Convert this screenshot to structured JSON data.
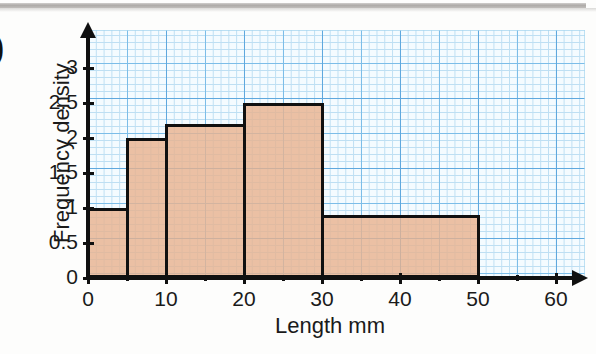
{
  "page": {
    "question_bracket": ")",
    "background_color": "#fdfdfc"
  },
  "chart_data": {
    "type": "bar",
    "title": "",
    "subtitle": "",
    "xlabel": "Length mm",
    "ylabel": "Frequency density",
    "xlim": [
      0,
      64
    ],
    "ylim": [
      0,
      3.4
    ],
    "grid": true,
    "grid_style": "graph-paper",
    "legend": null,
    "bar_fill_color": "#e9b28d",
    "bar_edge_color": "#101010",
    "grid_color": "#5fa8de",
    "axis_color": "#101010",
    "x_major_ticks": [
      0,
      10,
      20,
      30,
      40,
      50,
      60
    ],
    "x_major_tick_labels": [
      "0",
      "10",
      "20",
      "30",
      "40",
      "50",
      "60"
    ],
    "x_minor_ticks": [
      5,
      15,
      25,
      35,
      45,
      55
    ],
    "y_ticks": [
      0,
      0.5,
      1,
      1.5,
      2,
      2.5,
      3
    ],
    "y_tick_labels": [
      "0",
      "0.5",
      "1",
      "1.5",
      "2",
      "2.5",
      "3"
    ],
    "bins": [
      {
        "label": "0-5",
        "x_start": 0,
        "x_end": 5,
        "frequency_density": 1,
        "width": 5,
        "frequency": 5
      },
      {
        "label": "5-10",
        "x_start": 5,
        "x_end": 10,
        "frequency_density": 2,
        "width": 5,
        "frequency": 10
      },
      {
        "label": "10-20",
        "x_start": 10,
        "x_end": 20,
        "frequency_density": 2.2,
        "width": 10,
        "frequency": 22
      },
      {
        "label": "20-30",
        "x_start": 20,
        "x_end": 30,
        "frequency_density": 2.5,
        "width": 10,
        "frequency": 25
      },
      {
        "label": "30-50",
        "x_start": 30,
        "x_end": 50,
        "frequency_density": 0.9,
        "width": 20,
        "frequency": 18
      }
    ],
    "categories": [
      "0-5",
      "5-10",
      "10-20",
      "20-30",
      "30-50"
    ],
    "values": [
      1,
      2,
      2.2,
      2.5,
      0.9
    ]
  }
}
